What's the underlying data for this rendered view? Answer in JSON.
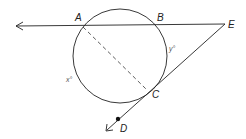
{
  "diagram": {
    "type": "geometry-circle-secant-tangent",
    "points": {
      "A": {
        "label": "A",
        "x": 82,
        "y": 25
      },
      "B": {
        "label": "B",
        "x": 158,
        "y": 24
      },
      "C": {
        "label": "C",
        "x": 146,
        "y": 92
      },
      "D": {
        "label": "D",
        "x": 118,
        "y": 119
      },
      "E": {
        "label": "E",
        "x": 225,
        "y": 24
      }
    },
    "circle": {
      "cx": 120,
      "cy": 56,
      "r": 47
    },
    "arc_labels": {
      "x": "x°",
      "y": "y°"
    },
    "segments": [
      {
        "from": "E",
        "to": "A",
        "style": "ray",
        "note": "secant through B and A extending left with arrow"
      },
      {
        "from": "E",
        "to": "D",
        "style": "ray",
        "note": "tangent at C extending past D with arrow"
      },
      {
        "from": "A",
        "to": "C",
        "style": "dashed"
      }
    ],
    "colors": {
      "stroke": "#222222",
      "label": "#222222",
      "arc_label": "#555555",
      "background": "#ffffff"
    }
  }
}
